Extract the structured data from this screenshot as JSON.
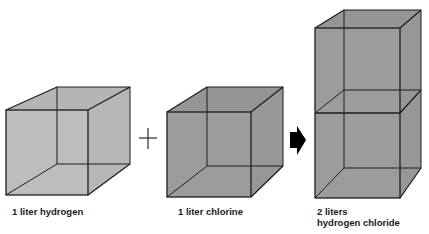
{
  "diagram": {
    "colors": {
      "cube_fill_light": "#bdbdbd",
      "cube_fill_dark": "#9c9c9c",
      "edge": "#1e1e1e",
      "arrow": "#000000",
      "plus": "#3a3a3a"
    },
    "operator_symbol": "plus",
    "result_symbol": "right-arrow",
    "items": [
      {
        "name": "hydrogen",
        "label_lines": [
          "1 liter hydrogen"
        ],
        "volume_liters": 1
      },
      {
        "name": "chlorine",
        "label_lines": [
          "1 liter chlorine"
        ],
        "volume_liters": 1
      },
      {
        "name": "hydrogen-chloride",
        "label_lines": [
          "2 liters",
          "hydrogen chloride"
        ],
        "volume_liters": 2
      }
    ]
  }
}
